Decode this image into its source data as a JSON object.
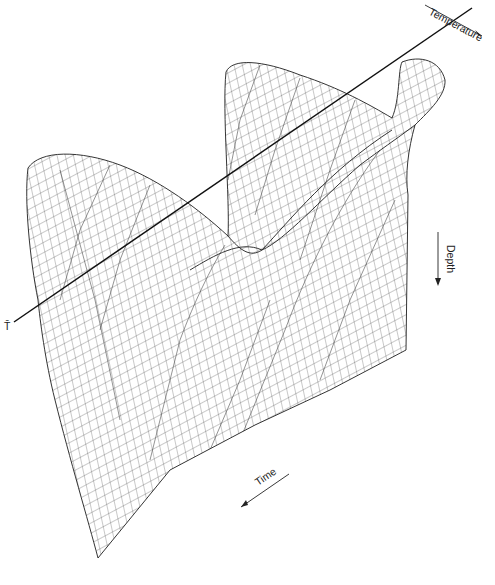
{
  "figure": {
    "axes": {
      "temperature_label": "Temperature",
      "depth_label": "Depth",
      "time_label": "Time",
      "mean_temperature_label": "T̄"
    },
    "colors": {
      "background": "#ffffff",
      "mesh": "#3a3a3a",
      "axis_line": "#111111"
    }
  }
}
